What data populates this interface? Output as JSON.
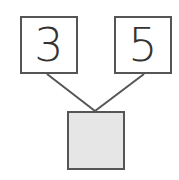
{
  "diagram": {
    "type": "number-bond",
    "parts": [
      {
        "value": "3"
      },
      {
        "value": "5"
      }
    ],
    "whole": {
      "value": "",
      "shaded": true,
      "fill": "#e6e6e6"
    },
    "colors": {
      "stroke": "#555555",
      "text": "#333333"
    }
  }
}
